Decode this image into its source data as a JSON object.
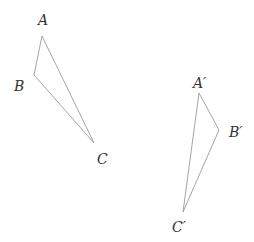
{
  "diagram": {
    "type": "geometry-transformation",
    "stroke_color": "#9a9a9a",
    "label_color": "#333333",
    "triangles": [
      {
        "name": "original",
        "vertices": [
          {
            "label": "A",
            "x": 42,
            "y": 36,
            "label_x": 38,
            "label_y": 25
          },
          {
            "label": "B",
            "x": 34,
            "y": 75,
            "label_x": 14,
            "label_y": 91
          },
          {
            "label": "C",
            "x": 94,
            "y": 143,
            "label_x": 97,
            "label_y": 164
          }
        ]
      },
      {
        "name": "image",
        "vertices": [
          {
            "label": "A′",
            "x": 199,
            "y": 93,
            "label_x": 193,
            "label_y": 88
          },
          {
            "label": "B′",
            "x": 219,
            "y": 130,
            "label_x": 229,
            "label_y": 137
          },
          {
            "label": "C′",
            "x": 183,
            "y": 212,
            "label_x": 172,
            "label_y": 232
          }
        ]
      }
    ]
  }
}
